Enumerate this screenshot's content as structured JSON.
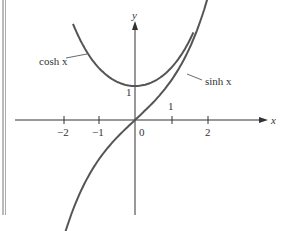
{
  "chart_data": {
    "type": "line",
    "title": "",
    "xlabel": "x",
    "ylabel": "y",
    "xlim": [
      -3.7,
      4.1
    ],
    "ylim": [
      -2.75,
      3.0
    ],
    "grid": false,
    "legend": "none (inline labels)",
    "x_ticks": [
      -2,
      -1,
      0,
      1,
      2
    ],
    "x_tick_labels": [
      "−2",
      "−1",
      "0",
      "",
      "2"
    ],
    "y_ticks": [
      1
    ],
    "y_tick_labels": [
      "1"
    ],
    "annotations": [
      "cosh x",
      "sinh x",
      "1"
    ],
    "series": [
      {
        "name": "cosh x",
        "x": [
          -1.7,
          -1.5,
          -1.0,
          -0.5,
          0,
          0.5,
          1.0,
          1.5,
          1.6
        ],
        "values": [
          2.83,
          2.35,
          1.54,
          1.13,
          1.0,
          1.13,
          1.54,
          2.35,
          2.58
        ]
      },
      {
        "name": "sinh x",
        "x": [
          -2.1,
          -1.5,
          -1.0,
          -0.5,
          0,
          0.5,
          1.0,
          1.5,
          2.0
        ],
        "values": [
          -2.7,
          -2.13,
          -1.18,
          -0.52,
          0,
          0.52,
          1.18,
          2.13,
          2.7
        ]
      }
    ]
  },
  "labels": {
    "y_axis": "y",
    "x_axis": "x",
    "cosh": "cosh x",
    "sinh": "sinh x",
    "tick_m2": "−2",
    "tick_m1": "−1",
    "tick_0": "0",
    "tick_2": "2",
    "y_one": "1",
    "x_one": "1"
  },
  "colors": {
    "curve": "#555555",
    "axis": "#333333"
  }
}
